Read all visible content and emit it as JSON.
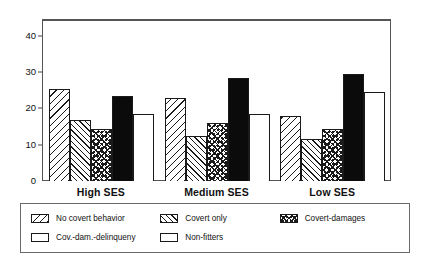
{
  "chart_data": {
    "type": "bar",
    "title": "",
    "subtitle": "",
    "xlabel": "",
    "ylabel": "",
    "categories": [
      "High SES",
      "Medium SES",
      "Low SES"
    ],
    "series": [
      {
        "name": "No covert behavior",
        "pattern": "diagonal-hatch-left",
        "values": [
          25.5,
          23.0,
          18.0
        ]
      },
      {
        "name": "Covert only",
        "pattern": "diagonal-hatch-right",
        "values": [
          17.0,
          12.5,
          11.5
        ]
      },
      {
        "name": "Covert-damages",
        "pattern": "crosshatch-dots",
        "values": [
          14.5,
          16.0,
          14.5
        ]
      },
      {
        "name": "Cov.-dam.-delinqueny",
        "pattern": "solid-black",
        "values": [
          23.5,
          28.5,
          29.5
        ]
      },
      {
        "name": "Non-fitters",
        "pattern": "plain-white",
        "values": [
          18.5,
          18.5,
          24.5
        ]
      }
    ],
    "ylim": [
      0,
      44.5
    ],
    "yticks": [
      0,
      10,
      20,
      30,
      40
    ],
    "ytick_labels": [
      "0",
      "10",
      "20",
      "30",
      "40"
    ],
    "grid": false,
    "legend_position": "bottom",
    "legend_columns": 3,
    "colors": {
      "ink": "#1a1a1a",
      "solid_series": "#0b0b0b",
      "background": "#ffffff",
      "frame": "#555555"
    }
  },
  "legend": {
    "rows": [
      [
        {
          "label": "No covert behavior",
          "swatch": "diagonal-hatch-left-swatch"
        },
        {
          "label": "Covert only",
          "swatch": "diagonal-hatch-right-swatch"
        },
        {
          "label": "Covert-damages",
          "swatch": "crosshatch-dots-swatch"
        }
      ],
      [
        {
          "label": "Cov.-dam.-delinqueny",
          "swatch": "solid-black-swatch"
        },
        {
          "label": "Non-fitters",
          "swatch": "plain-white-swatch"
        }
      ]
    ]
  }
}
